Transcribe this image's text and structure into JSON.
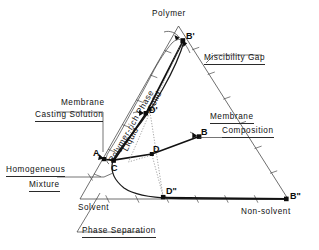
{
  "figure": {
    "type": "ternary-phase-diagram",
    "title_visible": false
  },
  "corners": {
    "top": "Polymer",
    "bottom_left": "Solvent",
    "bottom_right": "Non-solvent"
  },
  "annotations": {
    "membrane_casting_solution_line1": "Membrane",
    "membrane_casting_solution_line2": "Casting Solution",
    "homogeneous_line1": "Homogeneous",
    "homogeneous_line2": "Mixture",
    "miscibility_gap": "Miscibility Gap",
    "membrane_composition_line1": "Membrane",
    "membrane_composition_line2": "Composition",
    "phase_separation": "Phase Separation",
    "polymer_rich_phase": "Polymer-rich Phase",
    "solid": "Solid",
    "liquid": "Liquid"
  },
  "points": {
    "A": "A",
    "B": "B",
    "B_prime": "B'",
    "B_double_prime": "B\"",
    "C": "C",
    "D": "D",
    "D_prime": "D'",
    "D_double_prime": "D\""
  },
  "colors": {
    "line": "#111111",
    "triangle": "#4a4a4a",
    "background": "#ffffff",
    "dotted": "#7d7d7d"
  }
}
